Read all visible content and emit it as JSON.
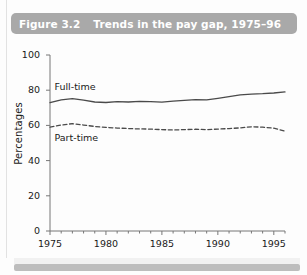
{
  "figure": {
    "number": "Figure 3.2",
    "caption": "Trends in the pay gap, 1975–96",
    "banner_color": "#a9a9a9",
    "banner_text_color": "#ffffff"
  },
  "chart_data": {
    "type": "line",
    "title": "Trends in the pay gap, 1975–96",
    "xlabel": "",
    "ylabel": "Percentages",
    "xlim": [
      1975,
      1996
    ],
    "ylim": [
      0,
      100
    ],
    "ytick_labels": [
      "0",
      "20",
      "40",
      "60",
      "80",
      "100"
    ],
    "yticks": [
      0,
      20,
      40,
      60,
      80,
      100
    ],
    "xtick_labels": [
      "1975",
      "1980",
      "1985",
      "1990",
      "1995"
    ],
    "xticks": [
      1975,
      1980,
      1985,
      1990,
      1995
    ],
    "minor_xticks": true,
    "grid": false,
    "legend_position": "inline-annotation",
    "x": [
      1975,
      1976,
      1977,
      1978,
      1979,
      1980,
      1981,
      1982,
      1983,
      1984,
      1985,
      1986,
      1987,
      1988,
      1989,
      1990,
      1991,
      1992,
      1993,
      1994,
      1995,
      1996
    ],
    "series": [
      {
        "name": "Full-time",
        "style": "solid",
        "color": "#4a4a4a",
        "values": [
          73.0,
          74.5,
          75.2,
          74.3,
          73.3,
          73.0,
          73.5,
          73.3,
          73.6,
          73.5,
          73.2,
          73.8,
          74.2,
          74.6,
          74.5,
          75.4,
          76.4,
          77.3,
          77.8,
          78.0,
          78.4,
          79.0
        ]
      },
      {
        "name": "Part-time",
        "style": "dashed",
        "color": "#4a4a4a",
        "values": [
          59.0,
          60.2,
          61.0,
          60.2,
          59.4,
          58.9,
          58.5,
          58.2,
          58.0,
          57.9,
          57.6,
          57.4,
          57.6,
          57.8,
          57.6,
          57.9,
          58.2,
          58.6,
          59.2,
          59.0,
          58.4,
          56.8
        ]
      }
    ],
    "annotations": [
      {
        "text": "Full-time",
        "x": 1975.4,
        "y": 81.5
      },
      {
        "text": "Part-time",
        "x": 1975.4,
        "y": 52.0
      }
    ]
  }
}
